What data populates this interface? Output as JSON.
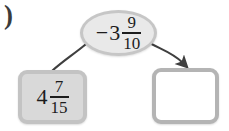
{
  "figure": {
    "kind": "number-operation-flow-diagram",
    "item_label": ")"
  },
  "oval": {
    "name": "operation-value",
    "sign": "−",
    "whole": "3",
    "numerator": "9",
    "denominator": "10",
    "full_text": "−3 9/10"
  },
  "left_box": {
    "name": "start-value",
    "sign": "",
    "whole": "4",
    "numerator": "7",
    "denominator": "15",
    "full_text": "4 7/15",
    "filled": "true"
  },
  "right_box": {
    "name": "answer-blank",
    "value": "",
    "full_text": "",
    "filled": "false"
  },
  "arrows": [
    {
      "name": "arrow-oval-to-left-box",
      "from": "oval",
      "to": "left_box",
      "arrowhead": "none"
    },
    {
      "name": "arrow-oval-to-right-box",
      "from": "oval",
      "to": "right_box",
      "arrowhead": "end"
    }
  ],
  "colors": {
    "oval_fill": "#e9e9e9",
    "oval_border": "#c6c6c6",
    "left_box_fill": "#d9d9d9",
    "left_box_border": "#c3c3c3",
    "right_box_fill": "#ffffff",
    "right_box_border": "#b4b4b4",
    "arrow": "#3f3f3f",
    "text": "#1c1c1c",
    "background": "#ffffff"
  }
}
